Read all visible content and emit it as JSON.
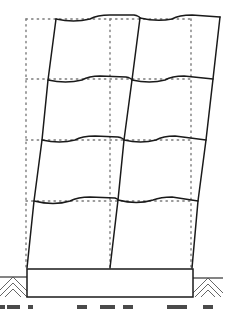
{
  "diagram": {
    "title_visible": false,
    "stories": 4,
    "bays": 2,
    "colors": {
      "deformed": "#1a1a1a",
      "original": "#7a7a7a",
      "background": "#ffffff"
    },
    "original_frame": {
      "columns_x": [
        26,
        110,
        191
      ],
      "floors_y": [
        19,
        79,
        140,
        201
      ],
      "base_y": 268
    },
    "deformed_columns": [
      [
        [
          56,
          19
        ],
        [
          48,
          80
        ],
        [
          42,
          140
        ],
        [
          34,
          201
        ],
        [
          27,
          268
        ]
      ],
      [
        [
          140,
          18
        ],
        [
          132,
          80
        ],
        [
          124,
          140
        ],
        [
          118,
          200
        ],
        [
          110,
          268
        ]
      ],
      [
        [
          220,
          17
        ],
        [
          213,
          79
        ],
        [
          206,
          140
        ],
        [
          198,
          201
        ],
        [
          192,
          268
        ]
      ]
    ],
    "deformed_beams": [
      "M56,19 Q74,23 90,19 Q97,15 110,15 L134,15 Q139,16 140,18",
      "M140,18 Q157,22 172,19 Q179,15 192,15 L220,17",
      "M48,80 Q66,84 82,80 Q89,76 100,76 L126,77 Q131,78 132,80",
      "M132,80 Q150,84 165,80 Q172,76 184,76 L213,79",
      "M42,140 Q60,144 75,140 Q82,136 95,136 L118,137 Q123,138 124,140",
      "M124,140 Q141,144 156,140 Q163,136 175,136 L206,140",
      "M34,201 Q54,206 70,201 Q78,197 90,197 L115,198 Q118,199 118,200",
      "M118,200 Q137,205 153,200 Q161,197 172,197 L198,201"
    ],
    "foundation": {
      "x": 27,
      "y": 269,
      "w": 166,
      "h": 28
    },
    "ground": [
      {
        "x1": 0,
        "x2": 27,
        "y": 277,
        "axis": 13
      },
      {
        "x1": 193,
        "x2": 223,
        "y": 278,
        "axis": 208
      }
    ],
    "caption_fragments_x": [
      [
        0,
        5
      ],
      [
        7,
        20
      ],
      [
        28,
        33
      ],
      [
        77,
        87
      ],
      [
        100,
        115
      ],
      [
        123,
        133
      ],
      [
        167,
        187
      ],
      [
        203,
        213
      ]
    ]
  }
}
